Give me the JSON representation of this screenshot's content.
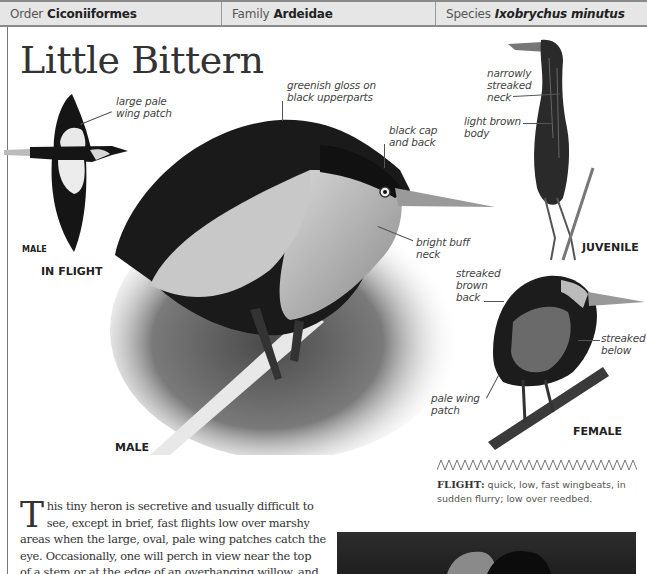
{
  "header": {
    "order_label": "Order",
    "order_value": "Ciconiiformes",
    "family_label": "Family",
    "family_value": "Ardeidae",
    "species_label": "Species",
    "species_value": "Ixobrychus minutus"
  },
  "title": "Little Bittern",
  "illustrations": {
    "in_flight": {
      "caption": "IN FLIGHT",
      "sex_label": "MALE",
      "callouts": [
        "large pale",
        "wing patch"
      ]
    },
    "male": {
      "caption": "MALE",
      "callouts": {
        "gloss": [
          "greenish gloss on",
          "black upperparts"
        ],
        "cap": [
          "black cap",
          "and back"
        ],
        "neck": [
          "bright buff",
          "neck"
        ]
      }
    },
    "juvenile": {
      "caption": "JUVENILE",
      "callouts": {
        "neck": [
          "narrowly",
          "streaked",
          "neck"
        ],
        "body": [
          "light brown",
          "body"
        ]
      }
    },
    "female": {
      "caption": "FEMALE",
      "callouts": {
        "back": [
          "streaked",
          "brown",
          "back"
        ],
        "below": [
          "streaked",
          "below"
        ],
        "wing": [
          "pale wing",
          "patch"
        ]
      }
    }
  },
  "flight": {
    "label": "FLIGHT:",
    "text": " quick, low, fast wingbeats, in sudden flurry; low over reedbed."
  },
  "body": {
    "dropcap": "T",
    "lines": [
      "his tiny heron is secretive and usually difficult to",
      "see, except in brief, fast flights low over marshy",
      "areas when the large, oval, pale wing patches catch the",
      "eye. Occasionally, one will perch in view near the top",
      "of a stem or at the edge of an overhanging willow, and"
    ]
  },
  "colors": {
    "header_bg": "#e6e6e6",
    "header_border": "#8a8a8a",
    "text": "#333333",
    "photo_dark": "#262626"
  }
}
